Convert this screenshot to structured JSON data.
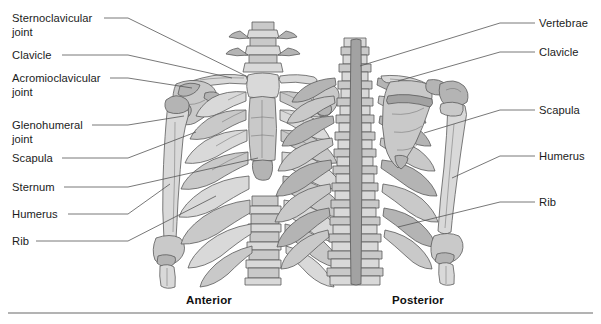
{
  "figure": {
    "background_color": "#ffffff",
    "bone_fill_light": "#d9d9d9",
    "bone_fill_mid": "#c4c4c4",
    "bone_fill_dark": "#a8a8a8",
    "bone_outline": "#5a5a5a",
    "leader_line_color": "#555555",
    "text_color": "#1c1c1c",
    "rule_color": "#9a9a9a"
  },
  "left_labels": [
    {
      "id": "sternoclavicular-joint",
      "text": "Sternoclavicular\njoint",
      "x": 12,
      "y": 12,
      "line_start_x": 104,
      "line_start_y": 18,
      "elbow_x": 128,
      "elbow_y": 18,
      "line_end_x": 248,
      "line_end_y": 77
    },
    {
      "id": "clavicle",
      "text": "Clavicle",
      "x": 12,
      "y": 49,
      "line_start_x": 62,
      "line_start_y": 55,
      "elbow_x": 128,
      "elbow_y": 55,
      "line_end_x": 232,
      "line_end_y": 78
    },
    {
      "id": "acromioclavicular-joint",
      "text": "Acromioclavicular\njoint",
      "x": 12,
      "y": 72,
      "line_start_x": 110,
      "line_start_y": 78,
      "elbow_x": 128,
      "elbow_y": 78,
      "line_end_x": 192,
      "line_end_y": 88
    },
    {
      "id": "glenohumeral-joint",
      "text": "Glenohumeral\njoint",
      "x": 12,
      "y": 119,
      "line_start_x": 92,
      "line_start_y": 125,
      "elbow_x": 128,
      "elbow_y": 125,
      "line_end_x": 184,
      "line_end_y": 116
    },
    {
      "id": "scapula",
      "text": "Scapula",
      "x": 12,
      "y": 152,
      "line_start_x": 62,
      "line_start_y": 158,
      "elbow_x": 128,
      "elbow_y": 158,
      "line_end_x": 196,
      "line_end_y": 132
    },
    {
      "id": "sternum",
      "text": "Sternum",
      "x": 12,
      "y": 181,
      "line_start_x": 64,
      "line_start_y": 187,
      "elbow_x": 128,
      "elbow_y": 187,
      "line_end_x": 258,
      "line_end_y": 158
    },
    {
      "id": "humerus",
      "text": "Humerus",
      "x": 12,
      "y": 208,
      "line_start_x": 68,
      "line_start_y": 214,
      "elbow_x": 128,
      "elbow_y": 214,
      "line_end_x": 170,
      "line_end_y": 184
    },
    {
      "id": "rib",
      "text": "Rib",
      "x": 12,
      "y": 235,
      "line_start_x": 36,
      "line_start_y": 241,
      "elbow_x": 128,
      "elbow_y": 241,
      "line_end_x": 216,
      "line_end_y": 196
    }
  ],
  "right_labels": [
    {
      "id": "vertebrae",
      "text": "Vertebrae",
      "x": 539,
      "y": 17,
      "line_start_x": 535,
      "line_start_y": 23,
      "elbow_x": 500,
      "elbow_y": 23,
      "line_end_x": 360,
      "line_end_y": 66
    },
    {
      "id": "clavicle",
      "text": "Clavicle",
      "x": 539,
      "y": 46,
      "line_start_x": 535,
      "line_start_y": 52,
      "elbow_x": 500,
      "elbow_y": 52,
      "line_end_x": 398,
      "line_end_y": 81
    },
    {
      "id": "scapula",
      "text": "Scapula",
      "x": 539,
      "y": 104,
      "line_start_x": 535,
      "line_start_y": 110,
      "elbow_x": 500,
      "elbow_y": 110,
      "line_end_x": 424,
      "line_end_y": 133
    },
    {
      "id": "humerus",
      "text": "Humerus",
      "x": 539,
      "y": 150,
      "line_start_x": 535,
      "line_start_y": 156,
      "elbow_x": 500,
      "elbow_y": 156,
      "line_end_x": 452,
      "line_end_y": 178
    },
    {
      "id": "rib",
      "text": "Rib",
      "x": 539,
      "y": 196,
      "line_start_x": 535,
      "line_start_y": 202,
      "elbow_x": 500,
      "elbow_y": 202,
      "line_end_x": 398,
      "line_end_y": 227
    }
  ],
  "captions": [
    {
      "id": "anterior",
      "text": "Anterior",
      "x": 186,
      "y": 294
    },
    {
      "id": "posterior",
      "text": "Posterior",
      "x": 392,
      "y": 294
    }
  ],
  "rule": {
    "x1": 8,
    "y1": 313,
    "x2": 593,
    "y2": 313
  }
}
